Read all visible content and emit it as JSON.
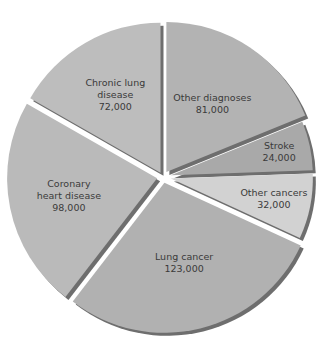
{
  "chart_data": {
    "type": "pie",
    "title": "",
    "start_angle": "12 o'clock",
    "direction": "clockwise",
    "exploded": true,
    "slices": [
      {
        "name": "Other diagnoses",
        "label_lines": [
          "Other diagnoses",
          "81,000"
        ],
        "value": 81000,
        "color": "#b3b3b3"
      },
      {
        "name": "Stroke",
        "label_lines": [
          "Stroke",
          "24,000"
        ],
        "value": 24000,
        "color": "#a9a9a9"
      },
      {
        "name": "Other cancers",
        "label_lines": [
          "Other cancers",
          "32,000"
        ],
        "value": 32000,
        "color": "#d2d2d2"
      },
      {
        "name": "Lung cancer",
        "label_lines": [
          "Lung cancer",
          "123,000"
        ],
        "value": 123000,
        "color": "#b1b1b1"
      },
      {
        "name": "Coronary heart disease",
        "label_lines": [
          "Coronary",
          "heart disease",
          "98,000"
        ],
        "value": 98000,
        "color": "#bababa"
      },
      {
        "name": "Chronic lung disease",
        "label_lines": [
          "Chronic lung",
          "disease",
          "72,000"
        ],
        "value": 72000,
        "color": "#bdbdbd"
      }
    ],
    "shadow_color": "#6e6e6e",
    "legend": "none"
  }
}
